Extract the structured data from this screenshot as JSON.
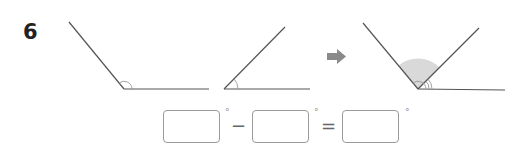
{
  "problem": {
    "number": "6"
  },
  "figures": {
    "angle_a": {
      "description": "obtuse angle with small arc at vertex",
      "icon": "angle-obtuse-icon"
    },
    "angle_b": {
      "description": "acute angle with small arc at vertex",
      "icon": "angle-acute-icon"
    },
    "arrow": {
      "icon": "arrow-right-icon",
      "color": "#8a8a8a"
    },
    "combined": {
      "description": "obtuse angle containing acute angle, difference shaded",
      "icon": "angle-difference-icon",
      "shade_color": "#d9d9d9"
    }
  },
  "equation": {
    "box1_value": "",
    "degree1": "°",
    "operator1": "−",
    "box2_value": "",
    "degree2": "°",
    "operator2": "=",
    "box3_value": "",
    "degree3": "°"
  },
  "colors": {
    "line": "#555555",
    "arc": "#999999",
    "box_border": "#9a9a9a"
  }
}
